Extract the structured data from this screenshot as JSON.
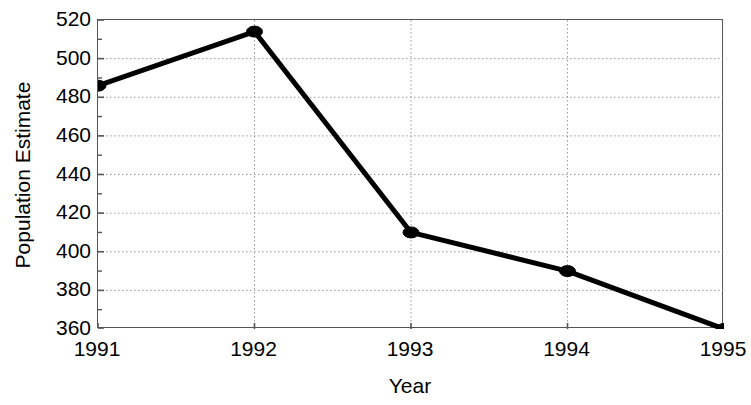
{
  "chart_data": {
    "type": "line",
    "title": "",
    "xlabel": "Year",
    "ylabel": "Population Estimate",
    "categories": [
      "1991",
      "1992",
      "1993",
      "1994",
      "1995"
    ],
    "x": [
      1991,
      1992,
      1993,
      1994,
      1995
    ],
    "values": [
      486,
      514,
      410,
      390,
      360
    ],
    "series": [
      {
        "name": "Population Estimate",
        "values": [
          486,
          514,
          410,
          390,
          360
        ]
      }
    ],
    "xlim": [
      1991,
      1995
    ],
    "ylim": [
      360,
      520
    ],
    "ytick_labels": [
      "520",
      "500",
      "480",
      "460",
      "440",
      "420",
      "400",
      "380",
      "360"
    ],
    "ytick_values": [
      520,
      500,
      480,
      460,
      440,
      420,
      400,
      380,
      360
    ],
    "ytick_minor_step": 10,
    "ytick_major_step": 20,
    "xtick_labels": [
      "1991",
      "1992",
      "1993",
      "1994",
      "1995"
    ],
    "grid": "horizontal-and-vertical-dotted",
    "grid_color": "#999999",
    "line_color": "#000000",
    "marker": "filled-circle",
    "marker_color": "#000000",
    "axis_color": "#555555",
    "legend": "none",
    "legend_position": "none"
  },
  "axis_titles": {
    "y": "Population Estimate",
    "x": "Year"
  }
}
